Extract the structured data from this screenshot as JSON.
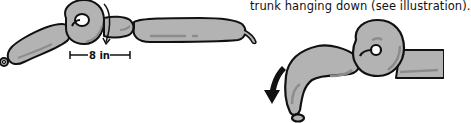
{
  "caption": {
    "text": "trunk hanging down (see illustration)."
  },
  "illustration_left": {
    "measurement_label": "8 in",
    "partial_label": "in"
  },
  "illustration_right": {
    "arrow": "arrow-down-curved-icon"
  },
  "colors": {
    "balloon_fill": "#b3b3b3",
    "balloon_stroke": "#111111",
    "highlight": "#8c8c8c",
    "background": "#ffffff"
  }
}
